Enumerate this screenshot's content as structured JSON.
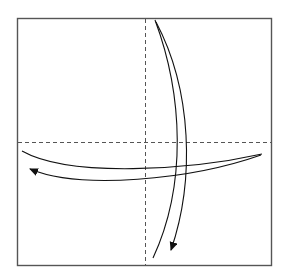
{
  "diagram": {
    "type": "origami-fold-instruction",
    "colors": {
      "paper_fill": "#ffffff",
      "paper_border": "#555555",
      "crease": "#555555",
      "arrow": "#111111"
    },
    "elements": [
      {
        "id": "paper-square",
        "kind": "square",
        "label": "paper"
      },
      {
        "id": "vertical-crease",
        "kind": "dashed-line",
        "orientation": "vertical",
        "style": "valley-fold"
      },
      {
        "id": "horizontal-crease",
        "kind": "dashed-line",
        "orientation": "horizontal",
        "style": "valley-fold"
      },
      {
        "id": "vertical-fold-arrow",
        "kind": "curved-arrow",
        "direction": "top-to-bottom"
      },
      {
        "id": "horizontal-fold-arrow",
        "kind": "curved-arrow",
        "direction": "right-to-left"
      }
    ]
  }
}
